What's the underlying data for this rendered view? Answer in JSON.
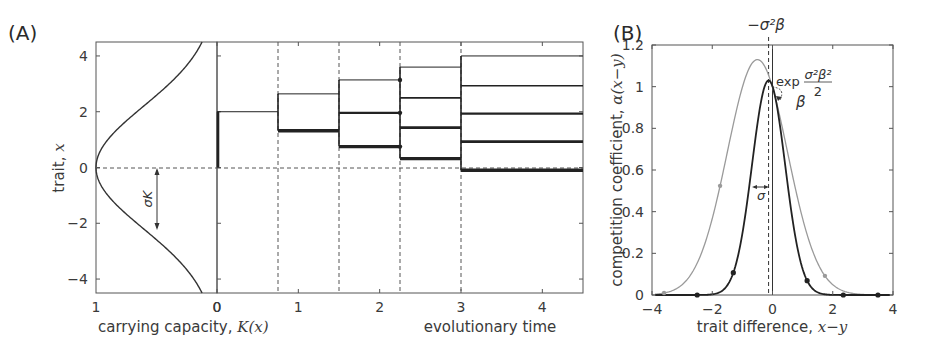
{
  "figure": {
    "panel_a_label": "(A)",
    "panel_b_label": "(B)"
  },
  "chart_data": [
    {
      "id": "A-left",
      "type": "line",
      "title": "",
      "xlabel": "carrying capacity, K(x)",
      "xlabel_text": "carrying capacity, ",
      "xlabel_math": "K(x)",
      "ylabel": "trait, x",
      "ylabel_text": "trait, ",
      "ylabel_math": "x",
      "xlim": [
        1,
        0
      ],
      "ylim": [
        -4.5,
        4.5
      ],
      "xticks": [
        "1",
        "0"
      ],
      "yticks": [
        "4",
        "2",
        "0",
        "−2",
        "−4"
      ],
      "ytick_values": [
        4,
        2,
        0,
        -2,
        -4
      ],
      "curve": {
        "name": "K(x)",
        "formula": "exp(-x^2/(2*sigmaK^2))",
        "sigmaK": 2.2
      },
      "annotation": {
        "label": "σK",
        "from_y": 0,
        "to_y": -2.2
      },
      "reference_line": {
        "y": 0,
        "style": "dashed"
      }
    },
    {
      "id": "A-main",
      "type": "line",
      "title": "",
      "xlabel": "evolutionary time",
      "ylabel": "trait, x",
      "xlim": [
        0,
        4.5
      ],
      "ylim": [
        -4.5,
        4.5
      ],
      "xticks": [
        "0",
        "1",
        "2",
        "3",
        "4"
      ],
      "xtick_values": [
        0,
        1,
        2,
        3,
        4
      ],
      "branching_times": [
        0.75,
        1.5,
        2.25,
        3.0
      ],
      "segments": [
        {
          "t0": 0,
          "t1": 0.75,
          "levels": [
            2.0
          ]
        },
        {
          "t0": 0.75,
          "t1": 1.5,
          "levels": [
            2.64,
            1.32
          ]
        },
        {
          "t0": 1.5,
          "t1": 2.25,
          "levels": [
            3.14,
            1.96,
            0.75
          ]
        },
        {
          "t0": 2.25,
          "t1": 3.0,
          "levels": [
            3.6,
            2.5,
            1.43,
            0.32
          ]
        },
        {
          "t0": 3.0,
          "t1": 4.5,
          "levels": [
            4.0,
            2.93,
            1.93,
            0.93,
            -0.1
          ]
        }
      ],
      "reference_line": {
        "y": 0,
        "style": "dashed"
      }
    },
    {
      "id": "B",
      "type": "line",
      "title": "",
      "xlabel": "trait difference, x−y",
      "xlabel_text": "trait difference, ",
      "xlabel_math": "x−y",
      "ylabel": "competition coefficient, α(x−y)",
      "ylabel_text": "competition coefficient, ",
      "ylabel_math": "α(x−y)",
      "xlim": [
        -4,
        4
      ],
      "ylim": [
        0,
        1.2
      ],
      "xticks": [
        "−4",
        "−2",
        "0",
        "2",
        "4"
      ],
      "xtick_values": [
        -4,
        -2,
        0,
        2,
        4
      ],
      "yticks": [
        "0",
        "0.2",
        "0.4",
        "0.6",
        "0.8",
        "1",
        "1.2"
      ],
      "ytick_values": [
        0,
        0.2,
        0.4,
        0.6,
        0.8,
        1.0,
        1.2
      ],
      "series": [
        {
          "name": "narrow (dark)",
          "color": "#222222",
          "peak_x": -0.13,
          "peak_y": 1.03,
          "width": 0.55,
          "markers_x": [
            -2.5,
            -1.3,
            1.15,
            2.35,
            3.5
          ]
        },
        {
          "name": "wide (gray)",
          "color": "#9a9a9a",
          "peak_x": -0.5,
          "peak_y": 1.13,
          "width": 1.0,
          "markers_x": [
            -3.6,
            -1.74,
            1.74
          ]
        }
      ],
      "vlines": [
        {
          "x": 0,
          "style": "solid"
        },
        {
          "x": -0.13,
          "style": "dashed",
          "label": "−σ²β"
        }
      ],
      "annotations": {
        "top_label": "−σ²β",
        "exp_word": "exp",
        "exp_numerator": "σ²β²",
        "exp_denominator": "2",
        "beta_label": "β",
        "sigma_label": "σ"
      }
    }
  ]
}
